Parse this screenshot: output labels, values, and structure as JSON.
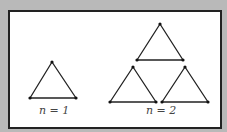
{
  "diagram": {
    "colors": {
      "background_border": "#b9b9b9",
      "frame_border": "#222222",
      "line": "#222222",
      "label": "#444444"
    },
    "figures": [
      {
        "label": "n = 1",
        "triangles": [
          {
            "apex": [
              52,
              62
            ],
            "left": [
              30,
              98
            ],
            "right": [
              76,
              98
            ]
          }
        ]
      },
      {
        "label": "n = 2",
        "triangles": [
          {
            "apex": [
              160,
              24
            ],
            "left": [
              137,
              60
            ],
            "right": [
              183,
              60
            ]
          },
          {
            "apex": [
              133,
              67
            ],
            "left": [
              110,
              102
            ],
            "right": [
              156,
              102
            ]
          },
          {
            "apex": [
              185,
              67
            ],
            "left": [
              162,
              102
            ],
            "right": [
              208,
              102
            ]
          }
        ]
      }
    ]
  }
}
